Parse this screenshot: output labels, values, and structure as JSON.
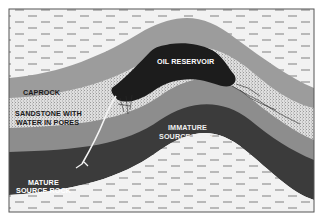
{
  "diagram": {
    "labels": {
      "oil_reservoir": "OIL RESERVOIR",
      "caprock": "CAPROCK",
      "sandstone_line1": "SANDSTONE WITH",
      "sandstone_line2": "WATER IN PORES",
      "immature_line1": "IMMATURE",
      "immature_line2": "SOURCE ROCK",
      "mature_line1": "MATURE",
      "mature_line2": "SOURCE ROCK"
    },
    "layers": [
      {
        "name": "overlying shale",
        "pattern": "dashed",
        "color": "#f2f2f2"
      },
      {
        "name": "caprock",
        "color": "#9a9a9a"
      },
      {
        "name": "oil reservoir",
        "color": "#1e1e1e"
      },
      {
        "name": "sandstone with water in pores",
        "pattern": "stippled",
        "color": "#d4d4d4"
      },
      {
        "name": "immature source rock",
        "color": "#8c8c8c"
      },
      {
        "name": "mature source rock",
        "color": "#3a3a3a"
      },
      {
        "name": "underlying shale",
        "pattern": "dashed",
        "color": "#f2f2f2"
      }
    ],
    "colors": {
      "frame": "#555555",
      "shale": "#f2f2f2",
      "dash": "#8a8a8a",
      "caprock": "#9c9c9c",
      "oil": "#1c1c1c",
      "sandstone": "#d6d6d6",
      "immature": "#8d8d8d",
      "mature": "#3b3b3b",
      "migration": "#f4f4f4",
      "label_light": "#ffffff",
      "label_dark": "#1a1a1a"
    }
  }
}
